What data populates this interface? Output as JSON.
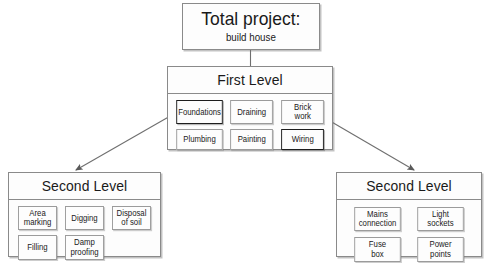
{
  "diagram": {
    "root": {
      "title": "Total project:",
      "subtitle": "build house"
    },
    "first_level": {
      "title": "First Level",
      "tasks": [
        {
          "label": "Foundations",
          "highlighted": true
        },
        {
          "label": "Draining",
          "highlighted": false
        },
        {
          "label": "Brick\nwork",
          "highlighted": false
        },
        {
          "label": "Plumbing",
          "highlighted": false
        },
        {
          "label": "Painting",
          "highlighted": false
        },
        {
          "label": "Wiring",
          "highlighted": true
        }
      ]
    },
    "second_level_left": {
      "title": "Second Level",
      "tasks": [
        {
          "label": "Area\nmarking"
        },
        {
          "label": "Digging"
        },
        {
          "label": "Disposal\nof soil"
        },
        {
          "label": "Filling"
        },
        {
          "label": "Damp\nproofing"
        }
      ]
    },
    "second_level_right": {
      "title": "Second Level",
      "tasks": [
        {
          "label": "Mains\nconnection"
        },
        {
          "label": "Light\nsockets"
        },
        {
          "label": "Fuse\nbox"
        },
        {
          "label": "Power\npoints"
        }
      ]
    },
    "colors": {
      "background": "#ffffff",
      "box_fill": "#fdfdfd",
      "box_border": "#8a8a8a",
      "highlight_border": "#1d1d1d",
      "connector": "#6f6f6f",
      "text": "#1a1a1a"
    }
  }
}
